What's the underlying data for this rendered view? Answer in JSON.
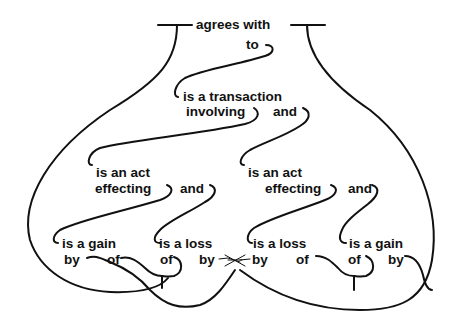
{
  "diagram": {
    "type": "semantic-network / conceptual-graph",
    "stroke_color": "#111111",
    "background": "#ffffff",
    "root": {
      "label": "agrees with",
      "sub": "to"
    },
    "level1": {
      "line1": "is a transaction",
      "line2": "involving",
      "conj": "and"
    },
    "level2_left": {
      "line1": "is an act",
      "line2": "effecting",
      "conj": "and"
    },
    "level2_right": {
      "line1": "is an act",
      "line2": "effecting",
      "conj": "and"
    },
    "leaves": [
      {
        "head": "is a gain",
        "role1": "by",
        "role2": "of"
      },
      {
        "head": "is a loss",
        "role1": "of",
        "role2": "by"
      },
      {
        "head": "is a loss",
        "role1": "by",
        "role2": "of"
      },
      {
        "head": "is a gain",
        "role1": "of",
        "role2": "by"
      }
    ]
  }
}
